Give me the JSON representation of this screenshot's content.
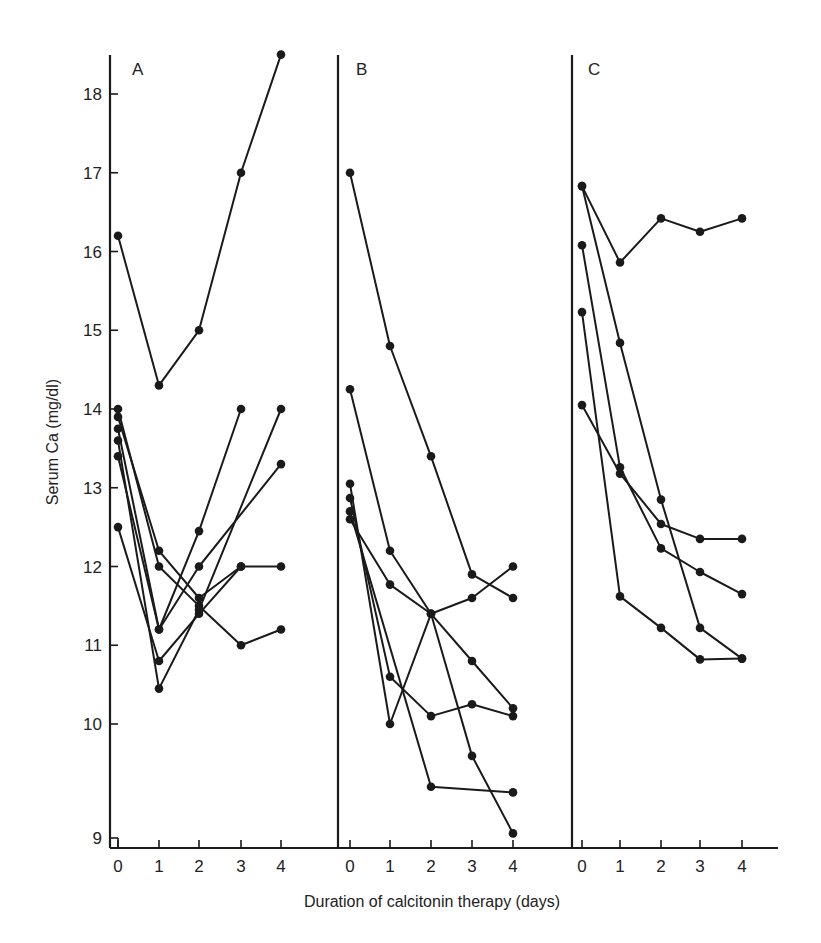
{
  "chart_data": {
    "type": "line",
    "title": "",
    "xlabel": "Duration of calcitonin therapy (days)",
    "ylabel": "Serum Ca (mg/dl)",
    "x_ticks": [
      "0",
      "1",
      "2",
      "3",
      "4"
    ],
    "y_ticks": [
      "9",
      "10",
      "11",
      "12",
      "13",
      "14",
      "15",
      "16",
      "17",
      "18"
    ],
    "ylim": [
      9,
      18.6
    ],
    "y_axis_note": "broken/compressed between 9 and 10",
    "grid": false,
    "legend": "none",
    "marker": "filled-circle",
    "panels": [
      {
        "label": "A",
        "series": [
          {
            "name": "A1",
            "points": [
              [
                0,
                16.2
              ],
              [
                1,
                14.3
              ],
              [
                2,
                15.0
              ],
              [
                3,
                17.0
              ],
              [
                4,
                18.5
              ]
            ]
          },
          {
            "name": "A2",
            "points": [
              [
                0,
                13.75
              ],
              [
                1,
                11.2
              ],
              [
                2,
                12.45
              ],
              [
                3,
                14.0
              ]
            ]
          },
          {
            "name": "A3",
            "points": [
              [
                0,
                13.4
              ],
              [
                1,
                11.2
              ],
              [
                2,
                12.0
              ],
              [
                4,
                13.3
              ]
            ]
          },
          {
            "name": "A4",
            "points": [
              [
                0,
                13.6
              ],
              [
                1,
                10.45
              ],
              [
                2,
                11.45
              ],
              [
                4,
                14.0
              ]
            ]
          },
          {
            "name": "A5",
            "points": [
              [
                0,
                12.5
              ],
              [
                1,
                10.8
              ],
              [
                2,
                11.4
              ],
              [
                3,
                12.0
              ],
              [
                4,
                12.0
              ]
            ]
          },
          {
            "name": "A6",
            "points": [
              [
                0,
                13.9
              ],
              [
                1,
                12.2
              ],
              [
                2,
                11.6
              ],
              [
                3,
                12.0
              ]
            ]
          },
          {
            "name": "A7",
            "points": [
              [
                0,
                14.0
              ],
              [
                1,
                12.0
              ],
              [
                2,
                11.5
              ],
              [
                3,
                11.0
              ],
              [
                4,
                11.2
              ]
            ]
          }
        ]
      },
      {
        "label": "B",
        "series": [
          {
            "name": "B1",
            "points": [
              [
                0,
                17.0
              ],
              [
                1,
                14.8
              ],
              [
                2,
                13.4
              ],
              [
                3,
                11.9
              ],
              [
                4,
                11.6
              ]
            ]
          },
          {
            "name": "B2",
            "points": [
              [
                0,
                14.25
              ],
              [
                1,
                12.2
              ],
              [
                2,
                11.4
              ],
              [
                3,
                10.8
              ],
              [
                4,
                10.2
              ]
            ]
          },
          {
            "name": "B3",
            "points": [
              [
                0,
                13.05
              ],
              [
                1,
                10.0
              ],
              [
                2,
                11.4
              ],
              [
                3,
                11.6
              ],
              [
                4,
                12.0
              ]
            ]
          },
          {
            "name": "B4",
            "points": [
              [
                0,
                12.6
              ],
              [
                1,
                11.77
              ],
              [
                2,
                11.4
              ],
              [
                3,
                9.72
              ],
              [
                4,
                9.04
              ]
            ]
          },
          {
            "name": "B5",
            "points": [
              [
                0,
                12.87
              ],
              [
                1,
                10.6
              ],
              [
                2,
                10.1
              ],
              [
                3,
                10.25
              ],
              [
                4,
                10.1
              ]
            ]
          },
          {
            "name": "B6",
            "points": [
              [
                0,
                12.7
              ],
              [
                2,
                9.45
              ],
              [
                4,
                9.4
              ]
            ]
          }
        ]
      },
      {
        "label": "C",
        "series": [
          {
            "name": "C1",
            "points": [
              [
                0,
                16.83
              ],
              [
                1,
                15.86
              ],
              [
                2,
                16.42
              ],
              [
                3,
                16.25
              ],
              [
                4,
                16.42
              ]
            ]
          },
          {
            "name": "C2",
            "points": [
              [
                0,
                16.83
              ],
              [
                1,
                14.84
              ],
              [
                2,
                12.85
              ],
              [
                3,
                11.22
              ],
              [
                4,
                10.83
              ]
            ]
          },
          {
            "name": "C3",
            "points": [
              [
                0,
                16.08
              ],
              [
                1,
                13.26
              ],
              [
                2,
                12.23
              ],
              [
                3,
                11.93
              ],
              [
                4,
                11.65
              ]
            ]
          },
          {
            "name": "C4",
            "points": [
              [
                0,
                15.23
              ],
              [
                1,
                11.62
              ],
              [
                2,
                11.22
              ],
              [
                3,
                10.82
              ],
              [
                4,
                10.83
              ]
            ]
          },
          {
            "name": "C5",
            "points": [
              [
                0,
                14.05
              ],
              [
                1,
                13.18
              ],
              [
                2,
                12.54
              ],
              [
                3,
                12.35
              ],
              [
                4,
                12.35
              ]
            ]
          }
        ]
      }
    ]
  }
}
